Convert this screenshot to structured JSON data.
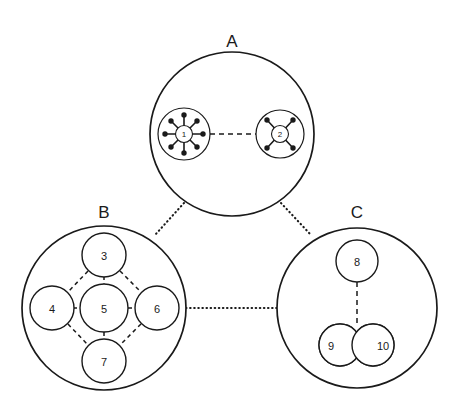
{
  "figure": {
    "background_color": "#ffffff",
    "stroke_color": "#1a1a1a",
    "width": 463,
    "height": 415
  },
  "clusters": [
    {
      "id": "A",
      "label": "A",
      "label_x": 232,
      "label_y": 41,
      "cx": 232,
      "cy": 134,
      "r": 82,
      "nodes": [
        "1",
        "2"
      ]
    },
    {
      "id": "B",
      "label": "B",
      "label_x": 104,
      "label_y": 212,
      "cx": 104,
      "cy": 308,
      "r": 82,
      "nodes": [
        "3",
        "4",
        "5",
        "6",
        "7"
      ]
    },
    {
      "id": "C",
      "label": "C",
      "label_x": 357,
      "label_y": 212,
      "cx": 357,
      "cy": 308,
      "r": 80,
      "nodes": [
        "8",
        "9",
        "10"
      ]
    }
  ],
  "nodes": [
    {
      "id": "1",
      "label": "1",
      "cluster": "A",
      "cx": 184,
      "cy": 134,
      "r": 9,
      "ring_r": 26,
      "spokes": 8,
      "style": "hub-spoke-8"
    },
    {
      "id": "2",
      "label": "2",
      "cluster": "A",
      "cx": 280,
      "cy": 134,
      "r": 9,
      "ring_r": 24,
      "spokes": 4,
      "style": "hub-spoke-4"
    },
    {
      "id": "3",
      "label": "3",
      "cluster": "B",
      "cx": 104,
      "cy": 255,
      "r": 22,
      "style": "plain"
    },
    {
      "id": "4",
      "label": "4",
      "cluster": "B",
      "cx": 52,
      "cy": 308,
      "r": 22,
      "style": "plain"
    },
    {
      "id": "5",
      "label": "5",
      "cluster": "B",
      "cx": 104,
      "cy": 308,
      "r": 24,
      "style": "plain"
    },
    {
      "id": "6",
      "label": "6",
      "cluster": "B",
      "cx": 157,
      "cy": 308,
      "r": 22,
      "style": "plain"
    },
    {
      "id": "7",
      "label": "7",
      "cluster": "B",
      "cx": 104,
      "cy": 361,
      "r": 22,
      "style": "plain"
    },
    {
      "id": "8",
      "label": "8",
      "cluster": "C",
      "cx": 357,
      "cy": 261,
      "r": 21,
      "style": "plain"
    },
    {
      "id": "9",
      "label": "9",
      "cluster": "C",
      "cx": 340,
      "cy": 345,
      "r": 21,
      "style": "overlap-left",
      "label_x": 332,
      "label_y": 345
    },
    {
      "id": "10",
      "label": "10",
      "cluster": "C",
      "cx": 373,
      "cy": 345,
      "r": 21,
      "style": "overlap-right",
      "label_x": 382,
      "label_y": 345
    }
  ],
  "edges": {
    "intra_dashed": [
      {
        "from": "1",
        "to": "2",
        "x1": 210,
        "y1": 134,
        "x2": 256,
        "y2": 134
      },
      {
        "from": "3",
        "to": "5",
        "x1": 104,
        "y1": 277,
        "x2": 104,
        "y2": 284
      },
      {
        "from": "4",
        "to": "5",
        "x1": 74,
        "y1": 308,
        "x2": 80,
        "y2": 308
      },
      {
        "from": "5",
        "to": "6",
        "x1": 128,
        "y1": 308,
        "x2": 135,
        "y2": 308
      },
      {
        "from": "5",
        "to": "7",
        "x1": 104,
        "y1": 332,
        "x2": 104,
        "y2": 339
      },
      {
        "from": "3",
        "to": "4",
        "x1": 88,
        "y1": 270,
        "x2": 67,
        "y2": 292
      },
      {
        "from": "3",
        "to": "6",
        "x1": 120,
        "y1": 270,
        "x2": 141,
        "y2": 292
      },
      {
        "from": "4",
        "to": "7",
        "x1": 67,
        "y1": 324,
        "x2": 88,
        "y2": 346
      },
      {
        "from": "6",
        "to": "7",
        "x1": 141,
        "y1": 324,
        "x2": 120,
        "y2": 346
      },
      {
        "from": "8",
        "to": "9-10",
        "x1": 357,
        "y1": 282,
        "x2": 357,
        "y2": 325
      }
    ],
    "inter_dotted": [
      {
        "from": "A",
        "to": "B",
        "x1": 184,
        "y1": 203,
        "x2": 155,
        "y2": 235
      },
      {
        "from": "A",
        "to": "C",
        "x1": 281,
        "y1": 203,
        "x2": 311,
        "y2": 235
      },
      {
        "from": "B",
        "to": "C",
        "x1": 186,
        "y1": 308,
        "x2": 277,
        "y2": 308
      }
    ]
  },
  "overlap_region": {
    "description": "hatched lens-shaped intersection of nodes 9 and 10",
    "hatch_angle_deg": 45,
    "fill_pattern": "diagonal-hatch"
  },
  "legend_note": {
    "dashed": "intra-cluster link",
    "dotted": "inter-cluster link",
    "hatched": "shared / overlapping membership"
  }
}
